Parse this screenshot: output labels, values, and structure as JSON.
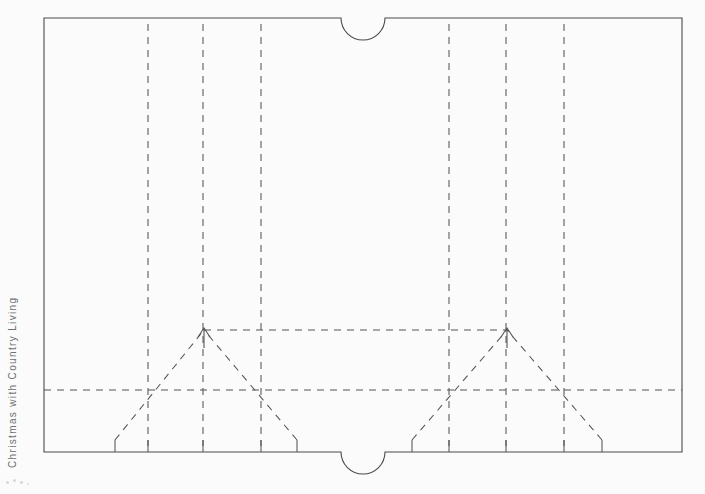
{
  "page": {
    "background_color": "#fbfbfb",
    "width": 705,
    "height": 494,
    "credit_text": "Christmas with Country Living",
    "credit_color": "#6e6e6e"
  },
  "diagram": {
    "line_color": "#555555",
    "border_color": "#4a4a4a",
    "dash_pattern": "7 6",
    "border": {
      "name": "outer-cut-outline",
      "left": 44,
      "top": 18,
      "right": 682,
      "bottom": 452,
      "notch_radius": 22,
      "notch_center_x": 363,
      "notch_top_label": "top-thumb-notch",
      "notch_bottom_label": "bottom-thumb-notch"
    },
    "fold_lines": {
      "vertical_full": [
        148,
        203,
        261,
        449,
        506,
        564
      ],
      "horizontal_full": [
        390
      ],
      "horizontal_partial": [
        {
          "y": 330,
          "x1": 204,
          "x2": 507
        }
      ],
      "vertical_short": [
        {
          "x": 115,
          "y1": 440,
          "y2": 452
        },
        {
          "x": 148,
          "y1": 440,
          "y2": 452
        },
        {
          "x": 203,
          "y1": 440,
          "y2": 452
        },
        {
          "x": 261,
          "y1": 440,
          "y2": 452
        },
        {
          "x": 297,
          "y1": 440,
          "y2": 452
        },
        {
          "x": 412,
          "y1": 440,
          "y2": 452
        },
        {
          "x": 449,
          "y1": 440,
          "y2": 452
        },
        {
          "x": 506,
          "y1": 440,
          "y2": 452
        },
        {
          "x": 564,
          "y1": 440,
          "y2": 452
        },
        {
          "x": 602,
          "y1": 440,
          "y2": 452
        }
      ]
    },
    "peaks": [
      {
        "name": "left-peak",
        "apex_x": 204,
        "apex_y": 330,
        "left_base_x": 115,
        "right_base_x": 297,
        "base_y": 440,
        "arrow": true
      },
      {
        "name": "right-peak",
        "apex_x": 507,
        "apex_y": 330,
        "left_base_x": 412,
        "right_base_x": 602,
        "base_y": 440,
        "arrow": true
      }
    ]
  },
  "corner_dots": [
    {
      "x": 2,
      "y": 4,
      "r": 1.6
    },
    {
      "x": 9,
      "y": 2,
      "r": 1.6
    },
    {
      "x": 16,
      "y": 4,
      "r": 1.4
    },
    {
      "x": 23,
      "y": 6,
      "r": 1.2
    }
  ]
}
